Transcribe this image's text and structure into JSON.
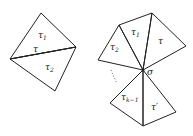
{
  "left_figure": {
    "labels": {
      "upper_triangle": "τ",
      "upper_triangle_sub": "1",
      "shared_edge": "τ",
      "lower_triangle": "τ",
      "lower_triangle_sub": "2"
    }
  },
  "right_figure": {
    "labels": {
      "center_vertex": "σ",
      "tri_1": "τ",
      "tri_1_sub": "1",
      "tri_2": "τ",
      "tri_2_sub": "2",
      "tri_top_right": "τ",
      "tri_k_minus_1": "τ",
      "tri_k_minus_1_sub": "k−1",
      "tri_bottom_right": "τ′"
    }
  }
}
